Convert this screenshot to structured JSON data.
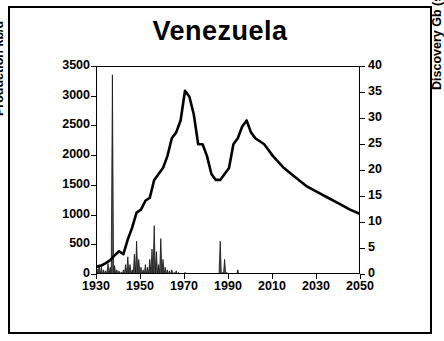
{
  "title": "Venezuela",
  "axes": {
    "y_left_label": "Production kb/d",
    "y_right_label": "Discovery Gb (shaded)",
    "y_left_ticks": [
      "0",
      "500",
      "1000",
      "1500",
      "2000",
      "2500",
      "3000",
      "3500"
    ],
    "y_right_ticks": [
      "0",
      "5",
      "10",
      "15",
      "20",
      "25",
      "30",
      "35",
      "40"
    ],
    "x_ticks": [
      "1930",
      "1950",
      "1970",
      "1990",
      "2010",
      "2030",
      "2050"
    ]
  },
  "chart_data": {
    "type": "line",
    "title": "Venezuela",
    "xlabel": "",
    "ylabel": "Production kb/d",
    "y2label": "Discovery Gb (shaded)",
    "xlim": [
      1930,
      2050
    ],
    "ylim": [
      0,
      3500
    ],
    "y2lim": [
      0,
      40
    ],
    "grid": false,
    "legend": "none",
    "series": [
      {
        "name": "Production kb/d",
        "type": "line",
        "axis": "left",
        "x": [
          1930,
          1932,
          1934,
          1936,
          1938,
          1940,
          1942,
          1944,
          1946,
          1948,
          1950,
          1952,
          1954,
          1956,
          1958,
          1960,
          1962,
          1964,
          1966,
          1968,
          1970,
          1972,
          1974,
          1976,
          1978,
          1980,
          1982,
          1984,
          1986,
          1988,
          1990,
          1992,
          1994,
          1996,
          1998,
          2000,
          2002,
          2004,
          2006,
          2010,
          2015,
          2020,
          2025,
          2030,
          2035,
          2040,
          2045,
          2050
        ],
        "y": [
          140,
          160,
          200,
          250,
          330,
          400,
          350,
          600,
          800,
          1050,
          1100,
          1250,
          1300,
          1600,
          1700,
          1800,
          2000,
          2300,
          2400,
          2600,
          3100,
          3000,
          2700,
          2200,
          2200,
          2000,
          1700,
          1600,
          1600,
          1700,
          1800,
          2200,
          2300,
          2500,
          2600,
          2400,
          2300,
          2250,
          2200,
          2000,
          1800,
          1650,
          1500,
          1400,
          1300,
          1200,
          1100,
          1020
        ]
      },
      {
        "name": "Discovery Gb",
        "type": "bar-shaded",
        "axis": "right",
        "x": [
          1930,
          1931,
          1932,
          1933,
          1934,
          1935,
          1936,
          1937,
          1938,
          1939,
          1940,
          1941,
          1942,
          1943,
          1944,
          1945,
          1946,
          1947,
          1948,
          1949,
          1950,
          1951,
          1952,
          1953,
          1954,
          1955,
          1956,
          1957,
          1958,
          1959,
          1960,
          1961,
          1962,
          1963,
          1964,
          1965,
          1966,
          1967,
          1968,
          1969,
          1970,
          1971,
          1972,
          1973,
          1974,
          1975,
          1976,
          1977,
          1978,
          1979,
          1980,
          1981,
          1982,
          1983,
          1984,
          1985,
          1986,
          1987,
          1988,
          1989,
          1990,
          1991,
          1992,
          1993,
          1994,
          1995,
          1996,
          1997,
          1998,
          1999,
          2000
        ],
        "y": [
          1.2,
          2.0,
          1.5,
          1.0,
          0.8,
          2.2,
          1.5,
          38.5,
          1.8,
          1.0,
          0.8,
          0.6,
          1.0,
          2.0,
          3.5,
          2.0,
          1.0,
          4.0,
          6.5,
          3.0,
          1.5,
          1.0,
          2.0,
          1.5,
          3.0,
          5.0,
          9.5,
          4.5,
          2.0,
          7.0,
          3.0,
          1.5,
          1.0,
          0.8,
          1.0,
          0.5,
          0.8,
          0.5,
          0.4,
          0.3,
          0.5,
          0.4,
          0.3,
          0.3,
          0.2,
          0.2,
          0.3,
          0.2,
          0.2,
          0.2,
          0.3,
          0.2,
          0.2,
          0.2,
          0.2,
          0.2,
          6.5,
          0.5,
          3.0,
          0.5,
          0.3,
          0.2,
          0.2,
          0.2,
          1.0,
          0.2,
          0.2,
          0.2,
          0.2,
          0.1,
          0.1
        ]
      }
    ]
  }
}
